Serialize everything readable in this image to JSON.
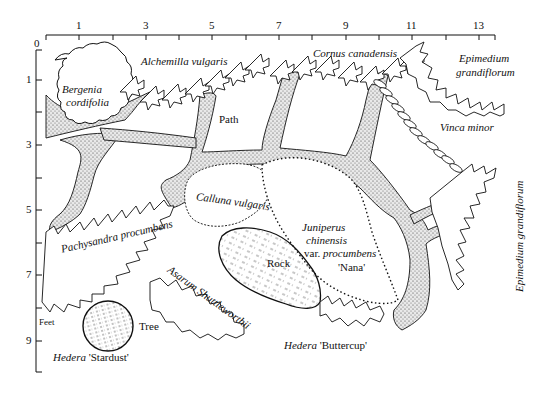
{
  "diagram": {
    "type": "garden planting plan",
    "units_label": "Feet",
    "x_axis": {
      "ticks": [
        "0",
        "1",
        "3",
        "5",
        "7",
        "9",
        "11",
        "13"
      ]
    },
    "y_axis": {
      "ticks": [
        "1",
        "3",
        "5",
        "7",
        "9"
      ]
    },
    "plants": {
      "alchemilla": "Alchemilla vulgaris",
      "bergenia_1": "Bergenia",
      "bergenia_2": "cordifolia",
      "cornus": "Cornus canadensis",
      "epimedium_top_1": "Epimedium",
      "epimedium_top_2": "grandiflorum",
      "vinca": "Vinca minor",
      "calluna": "Calluna vulgaris",
      "pachysandra": "Pachysandra procumbens",
      "juniperus_1": "Juniperus",
      "juniperus_2": "chinensis",
      "juniperus_3a": "var. ",
      "juniperus_3b": "procumbens",
      "juniperus_4": "'Nana'",
      "asarum": "Asarum Shuttleworthii",
      "epimedium_right": "Epimedium grandiflorum",
      "hedera_stardust_a": "Hedera",
      "hedera_stardust_b": " 'Stardust'",
      "hedera_buttercup_a": "Hedera",
      "hedera_buttercup_b": " 'Buttercup'"
    },
    "features": {
      "path": "Path",
      "rock": "Rock",
      "tree": "Tree"
    }
  }
}
